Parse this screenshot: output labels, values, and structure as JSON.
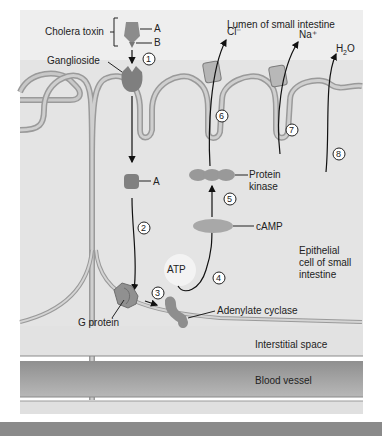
{
  "diagram": {
    "regions": {
      "lumen": "Lumen of small intestine",
      "cell_line1": "Epithelial",
      "cell_line2": "cell of small",
      "cell_line3": "intestine",
      "interstitial": "Interstitial space",
      "blood": "Blood vessel"
    },
    "labels": {
      "cholera_toxin": "Cholera toxin",
      "subunit_a": "A",
      "subunit_b": "B",
      "ganglioside": "Ganglioside",
      "a_fragment": "A",
      "g_protein": "G protein",
      "adenylate_cyclase": "Adenylate cyclase",
      "atp": "ATP",
      "camp": "cAMP",
      "protein_kinase_1": "Protein",
      "protein_kinase_2": "kinase",
      "cl": "Cl⁻",
      "na": "Na⁺",
      "h2o_h": "H",
      "h2o_2": "2",
      "h2o_o": "O"
    },
    "steps": [
      "1",
      "2",
      "3",
      "4",
      "5",
      "6",
      "7",
      "8"
    ],
    "colors": {
      "background": "#e6e6e6",
      "membrane": "#bdbdbd",
      "membrane_edge": "#8e8e8e",
      "protein": "#8c8c8c",
      "blood": "#a0a0a0",
      "bottom_bar": "#8a8a8a"
    }
  }
}
